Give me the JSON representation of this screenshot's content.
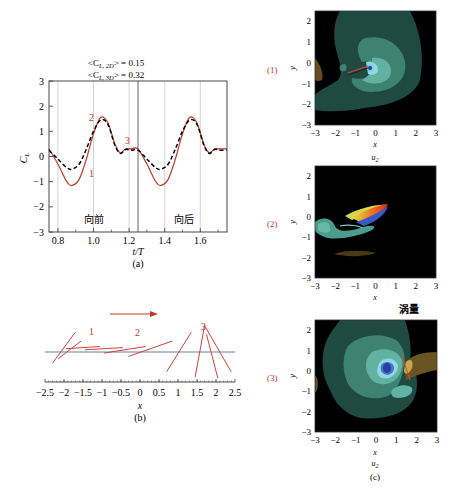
{
  "figure": {
    "panel_a_label": "(a)",
    "panel_b_label": "(b)",
    "panel_c_label": "(c)",
    "colors": {
      "solid_2d": "#c0392b",
      "dashed_3d": "#000000",
      "gridline": "#c8c8c8",
      "midline": "#555555",
      "baseline_b": "#6a7fa8",
      "plate_b": "#d0413a",
      "phase_label": "#c0392b"
    }
  },
  "chart_data": [
    {
      "id": "a",
      "type": "line",
      "title_lines": [
        "<C_L,2D> = 0.15",
        "<C_L,3D> = 0.32"
      ],
      "title_line1_main": "<C",
      "title_line1_sub": "L, 2D",
      "title_line1_rest": "> = 0.15",
      "title_line2_main": "<C",
      "title_line2_sub": "L, 3D",
      "title_line2_rest": "> = 0.32",
      "xlabel": "t/T",
      "ylabel": "C",
      "ylabel_sub": "L",
      "xlim": [
        0.75,
        1.75
      ],
      "ylim": [
        -3,
        3
      ],
      "xticks": [
        "0.8",
        "1.0",
        "1.2",
        "1.4",
        "1.6"
      ],
      "yticks": [
        "3",
        "2",
        "1",
        "0",
        "-1",
        "-2",
        "-3"
      ],
      "vertical_gridlines": [
        0.8,
        1.0,
        1.2,
        1.4,
        1.6
      ],
      "stroke_divider": 1.25,
      "annotations": {
        "phase_1": "1",
        "phase_2": "2",
        "phase_3": "3",
        "forward": "向前",
        "backward": "向后"
      },
      "series": [
        {
          "name": "2D (solid red)",
          "x": [
            0.75,
            0.8,
            0.85,
            0.88,
            0.92,
            0.96,
            1.0,
            1.04,
            1.08,
            1.12,
            1.15,
            1.18,
            1.21,
            1.25,
            1.3,
            1.35,
            1.38,
            1.42,
            1.46,
            1.5,
            1.54,
            1.58,
            1.62,
            1.65,
            1.68,
            1.71,
            1.75
          ],
          "values": [
            0.3,
            -0.3,
            -1.0,
            -1.15,
            -0.9,
            -0.1,
            0.9,
            1.55,
            1.35,
            0.5,
            0.15,
            0.3,
            0.3,
            0.3,
            -0.3,
            -1.0,
            -1.15,
            -0.9,
            -0.1,
            0.9,
            1.55,
            1.35,
            0.5,
            0.15,
            0.3,
            0.3,
            0.3
          ]
        },
        {
          "name": "3D (dashed black)",
          "x": [
            0.75,
            0.8,
            0.85,
            0.88,
            0.92,
            0.96,
            1.0,
            1.04,
            1.08,
            1.12,
            1.15,
            1.18,
            1.21,
            1.25,
            1.3,
            1.35,
            1.38,
            1.42,
            1.46,
            1.5,
            1.54,
            1.58,
            1.62,
            1.65,
            1.68,
            1.71,
            1.75
          ],
          "values": [
            0.25,
            -0.1,
            -0.45,
            -0.5,
            -0.3,
            0.3,
            1.0,
            1.45,
            1.3,
            0.45,
            0.12,
            0.28,
            0.25,
            0.25,
            -0.1,
            -0.45,
            -0.5,
            -0.3,
            0.3,
            1.0,
            1.45,
            1.3,
            0.45,
            0.12,
            0.28,
            0.25,
            0.25
          ]
        }
      ]
    },
    {
      "id": "b",
      "type": "line",
      "description": "Plate positions (chord lines) during forward stroke",
      "xlabel": "x",
      "xlim": [
        -2.5,
        2.5
      ],
      "xticks": [
        "-2.5",
        "-2",
        "-1.5",
        "-1",
        "-0.5",
        "0",
        "0.5",
        "1",
        "1.5",
        "2",
        "2.5"
      ],
      "arrow": "motion direction (to the right)",
      "annotations": {
        "phase_1": "1",
        "phase_2": "2",
        "phase_3": "3"
      },
      "plates": [
        [
          -2.3,
          -0.5,
          -1.7,
          0.9
        ],
        [
          -2.15,
          -0.3,
          -1.55,
          0.5
        ],
        [
          -1.95,
          0.15,
          -1.05,
          0.25
        ],
        [
          -1.45,
          0.1,
          -0.45,
          0.2
        ],
        [
          -0.95,
          -0.05,
          0.15,
          0.25
        ],
        [
          -0.3,
          -0.2,
          0.85,
          0.5
        ],
        [
          0.7,
          -0.9,
          1.35,
          0.9
        ],
        [
          1.45,
          -1.15,
          1.7,
          1.2
        ],
        [
          1.7,
          1.2,
          2.4,
          -0.9
        ],
        [
          1.75,
          0.8,
          2.05,
          -1.2
        ]
      ]
    },
    {
      "id": "c1",
      "type": "heatmap",
      "row_label": "(1)",
      "xlabel": "x",
      "ylabel": "y",
      "xlim": [
        -3,
        3
      ],
      "ylim": [
        -3,
        2.5
      ],
      "xticks": [
        "-3",
        "-2",
        "-1",
        "0",
        "1",
        "2",
        "3"
      ],
      "yticks": [
        "2",
        "1",
        "0",
        "-1",
        "-2",
        "-3"
      ],
      "caption_below": "u",
      "caption_below_sub": "2"
    },
    {
      "id": "c2",
      "type": "heatmap",
      "row_label": "(2)",
      "xlabel": "x",
      "ylabel": "y",
      "xlim": [
        -3,
        3
      ],
      "ylim": [
        -3,
        2.5
      ],
      "xticks": [
        "-3",
        "-2",
        "-1",
        "0",
        "1",
        "2",
        "3"
      ],
      "yticks": [
        "2",
        "1",
        "0",
        "-1",
        "-2",
        "-3"
      ],
      "caption_below": "涡量"
    },
    {
      "id": "c3",
      "type": "heatmap",
      "row_label": "(3)",
      "xlabel": "x",
      "ylabel": "y",
      "xlim": [
        -3,
        3
      ],
      "ylim": [
        -3,
        2.5
      ],
      "xticks": [
        "-3",
        "-2",
        "-1",
        "0",
        "1",
        "2",
        "3"
      ],
      "yticks": [
        "2",
        "1",
        "0",
        "-1",
        "-2",
        "-3"
      ],
      "caption_below": "u",
      "caption_below_sub": "2"
    }
  ]
}
